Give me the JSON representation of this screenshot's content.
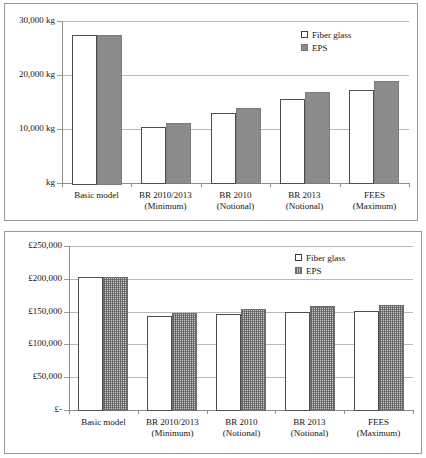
{
  "charts": [
    {
      "id": "embodied-carbon",
      "legend": [
        {
          "label": "Fiber glass",
          "swatch": "fiber-glass-swatch",
          "color": "#ffffff"
        },
        {
          "label": "EPS",
          "swatch": "eps-swatch",
          "color": "#8c8c8c"
        }
      ],
      "yticks": [
        "30,000 kg",
        "20,000 kg",
        "10,000 kg",
        "kg"
      ],
      "categories": [
        {
          "line1": "Basic model",
          "line2": ""
        },
        {
          "line1": "BR 2010/2013",
          "line2": "(Minimum)"
        },
        {
          "line1": "BR 2010",
          "line2": "(Notional)"
        },
        {
          "line1": "BR 2013",
          "line2": "(Notional)"
        },
        {
          "line1": "FEES",
          "line2": "(Maximum)"
        }
      ]
    },
    {
      "id": "lifecycle-cost",
      "legend": [
        {
          "label": "Fiber glass",
          "swatch": "fiber-glass-swatch",
          "color": "#ffffff"
        },
        {
          "label": "EPS",
          "swatch": "eps-swatch",
          "color": "#b9b9b9"
        }
      ],
      "yticks": [
        "£250,000",
        "£200,000",
        "£150,000",
        "£100,000",
        "£50,000",
        "£-"
      ],
      "categories": [
        {
          "line1": "Basic model",
          "line2": ""
        },
        {
          "line1": "BR 2010/2013",
          "line2": "(Minimum)"
        },
        {
          "line1": "BR 2010",
          "line2": "(Notional)"
        },
        {
          "line1": "BR 2013",
          "line2": "(Notional)"
        },
        {
          "line1": "FEES",
          "line2": "(Maximum)"
        }
      ]
    }
  ],
  "chart_data": [
    {
      "type": "bar",
      "title": "",
      "xlabel": "",
      "ylabel": "kg",
      "unit": "kg",
      "grid": true,
      "legend_position": "top-right",
      "ylim": [
        0,
        30000
      ],
      "yticks": [
        0,
        10000,
        20000,
        30000
      ],
      "ytick_labels": [
        "kg",
        "10,000 kg",
        "20,000 kg",
        "30,000 kg"
      ],
      "categories": [
        "Basic model",
        "BR 2010/2013 (Minimum)",
        "BR 2010 (Notional)",
        "BR 2013 (Notional)",
        "FEES (Maximum)"
      ],
      "series": [
        {
          "name": "Fiber glass",
          "values": [
            27500,
            10400,
            12900,
            15500,
            17200
          ]
        },
        {
          "name": "EPS",
          "values": [
            27500,
            11100,
            13900,
            16800,
            18800
          ]
        }
      ]
    },
    {
      "type": "bar",
      "title": "",
      "xlabel": "",
      "ylabel": "£",
      "unit": "£",
      "grid": true,
      "legend_position": "top-right",
      "ylim": [
        0,
        250000
      ],
      "yticks": [
        0,
        50000,
        100000,
        150000,
        200000,
        250000
      ],
      "ytick_labels": [
        "£-",
        "£50,000",
        "£100,000",
        "£150,000",
        "£200,000",
        "£250,000"
      ],
      "categories": [
        "Basic model",
        "BR 2010/2013 (Minimum)",
        "BR 2010 (Notional)",
        "BR 2013 (Notional)",
        "FEES (Maximum)"
      ],
      "series": [
        {
          "name": "Fiber glass",
          "values": [
            202500,
            143000,
            146500,
            150000,
            150500
          ]
        },
        {
          "name": "EPS",
          "values": [
            202000,
            148500,
            153500,
            158500,
            160500
          ]
        }
      ]
    }
  ]
}
